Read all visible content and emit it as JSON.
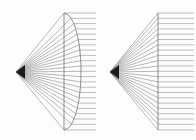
{
  "figure": {
    "background_color": "#fdfdfd",
    "width": 196,
    "height": 140,
    "ray_color": "#7d7d7d",
    "outgoing_ray_color": "#8a8a8a",
    "surface_color": "#6e6e6e",
    "vertex_color": "#1a1a1a"
  },
  "chart_data": {
    "type": "line",
    "xlabel": "",
    "ylabel": "",
    "xlim": [
      0,
      196
    ],
    "ylim": [
      0,
      140
    ],
    "grid": false,
    "legend": "none",
    "panels": [
      {
        "name": "left-panel",
        "label": "Curved refracting surface",
        "surface_type": "convex-arc",
        "vertex": {
          "x": 16,
          "y": 72
        },
        "plane_x": 64,
        "plane_y_top": 13,
        "plane_y_bottom": 130,
        "arc_bulge_x": 81,
        "ray_exit_x": 96,
        "ray_count": 23,
        "ray_y_values": [
          13,
          18.3,
          23.6,
          28.9,
          34.2,
          39.5,
          44.8,
          50.1,
          55.4,
          60.7,
          66.0,
          71.3,
          76.6,
          81.9,
          87.2,
          92.5,
          97.8,
          103.1,
          108.4,
          113.7,
          119.0,
          124.3,
          130
        ]
      },
      {
        "name": "right-panel",
        "label": "Flat refracting surface",
        "surface_type": "flat-plane",
        "vertex": {
          "x": 110,
          "y": 72
        },
        "plane_x": 158,
        "plane_y_top": 13,
        "plane_y_bottom": 130,
        "ray_exit_x": 194,
        "ray_count": 23,
        "ray_y_values": [
          13,
          18.3,
          23.6,
          28.9,
          34.2,
          39.5,
          44.8,
          50.1,
          55.4,
          60.7,
          66.0,
          71.3,
          76.6,
          81.9,
          87.2,
          92.5,
          97.8,
          103.1,
          108.4,
          113.7,
          119.0,
          124.3,
          130
        ]
      }
    ]
  }
}
